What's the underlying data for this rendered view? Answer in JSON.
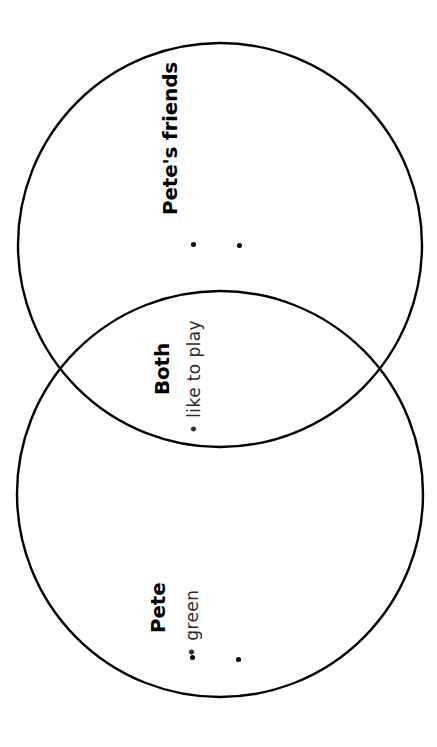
{
  "worksheet": {
    "type": "venn-diagram",
    "orientation": "rotated-90-ccw",
    "background_color": "#ffffff",
    "stroke_color": "#000000"
  },
  "sections": {
    "top": {
      "heading": "Pete's friends",
      "entries": [],
      "empty_bullets": 2
    },
    "overlap": {
      "heading": "Both",
      "entries": [
        {
          "bullet": "•",
          "text": "like to play"
        }
      ],
      "empty_bullets": 0
    },
    "bottom": {
      "heading": "Pete",
      "entries": [
        {
          "bullet": "•",
          "text": "green"
        }
      ],
      "empty_bullets": 2
    }
  },
  "circles": {
    "top": {
      "cx": 220,
      "cy": 245,
      "r": 202
    },
    "bottom": {
      "cx": 220,
      "cy": 494,
      "r": 203
    },
    "stroke_width": 2.4
  },
  "chart_data": {
    "type": "venn",
    "title": "",
    "sets": [
      {
        "name": "Pete's friends",
        "items": []
      },
      {
        "name": "Pete",
        "items": [
          "green"
        ]
      }
    ],
    "intersection": {
      "name": "Both",
      "items": [
        "like to play"
      ]
    }
  }
}
